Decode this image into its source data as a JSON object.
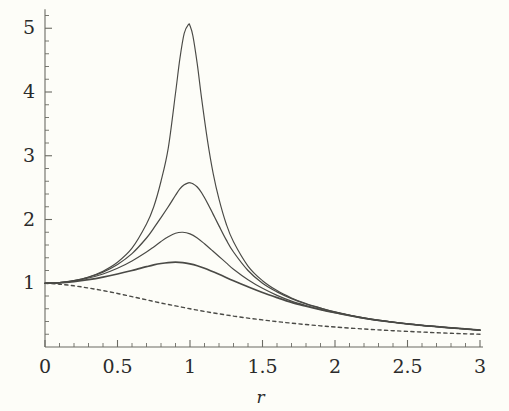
{
  "figure": {
    "background_color": "#fdfdf8",
    "axis_color": "#6b6b63",
    "curve_color": "#4a4a46",
    "text_color": "#2b2b2b"
  },
  "chart_data": {
    "type": "line",
    "title": "",
    "subtitle": "",
    "xlabel": "r",
    "ylabel": "",
    "xlim": [
      0,
      3
    ],
    "ylim": [
      0,
      5.35
    ],
    "grid": false,
    "legend": "none",
    "annotations": [],
    "x_ticks_major": [
      "0",
      "0.5",
      "1",
      "1.5",
      "2",
      "2.5",
      "3"
    ],
    "x_tick_values": [
      0,
      0.5,
      1,
      1.5,
      2,
      2.5,
      3
    ],
    "x_minor_tick_count_per_major": 5,
    "y_ticks_major": [
      "1",
      "2",
      "3",
      "4",
      "5"
    ],
    "y_tick_values": [
      1,
      2,
      3,
      4,
      5
    ],
    "y_minor_tick_count_per_major": 5,
    "series": [
      {
        "name": "zeta-0.10",
        "style": "solid",
        "peak_x": 1.06,
        "peak_y": 5.07,
        "x": [
          0.0,
          0.1,
          0.2,
          0.3,
          0.4,
          0.5,
          0.6,
          0.7,
          0.75,
          0.8,
          0.85,
          0.9,
          0.93,
          0.96,
          0.99,
          1.0,
          1.02,
          1.05,
          1.08,
          1.12,
          1.16,
          1.2,
          1.25,
          1.3,
          1.4,
          1.5,
          1.6,
          1.7,
          1.8,
          1.9,
          2.0,
          2.2,
          2.4,
          2.6,
          2.8,
          3.0
        ],
        "y": [
          1.0,
          1.01,
          1.042,
          1.099,
          1.19,
          1.33,
          1.55,
          1.93,
          2.2,
          2.6,
          3.12,
          3.98,
          4.52,
          4.92,
          5.06,
          5.04,
          4.88,
          4.44,
          3.9,
          3.25,
          2.72,
          2.32,
          1.93,
          1.65,
          1.27,
          1.04,
          0.885,
          0.77,
          0.68,
          0.61,
          0.55,
          0.455,
          0.39,
          0.34,
          0.3,
          0.265
        ]
      },
      {
        "name": "zeta-0.20",
        "style": "solid",
        "peak_x": 0.96,
        "peak_y": 2.58,
        "x": [
          0.0,
          0.1,
          0.2,
          0.3,
          0.4,
          0.5,
          0.6,
          0.7,
          0.75,
          0.8,
          0.85,
          0.9,
          0.93,
          0.96,
          0.99,
          1.0,
          1.02,
          1.05,
          1.08,
          1.12,
          1.16,
          1.2,
          1.25,
          1.3,
          1.4,
          1.5,
          1.6,
          1.7,
          1.8,
          1.9,
          2.0,
          2.2,
          2.4,
          2.6,
          2.8,
          3.0
        ],
        "y": [
          1.0,
          1.01,
          1.04,
          1.094,
          1.175,
          1.295,
          1.465,
          1.71,
          1.865,
          2.03,
          2.2,
          2.38,
          2.48,
          2.545,
          2.575,
          2.575,
          2.56,
          2.51,
          2.42,
          2.26,
          2.08,
          1.9,
          1.68,
          1.49,
          1.2,
          1.0,
          0.865,
          0.76,
          0.675,
          0.61,
          0.55,
          0.455,
          0.39,
          0.34,
          0.3,
          0.265
        ]
      },
      {
        "name": "zeta-0.30",
        "style": "solid",
        "peak_x": 0.9,
        "peak_y": 1.8,
        "x": [
          0.0,
          0.1,
          0.2,
          0.3,
          0.4,
          0.5,
          0.6,
          0.7,
          0.75,
          0.8,
          0.85,
          0.9,
          0.95,
          1.0,
          1.05,
          1.1,
          1.15,
          1.2,
          1.25,
          1.3,
          1.4,
          1.5,
          1.6,
          1.7,
          1.8,
          1.9,
          2.0,
          2.2,
          2.4,
          2.6,
          2.8,
          3.0
        ],
        "y": [
          1.0,
          1.009,
          1.036,
          1.082,
          1.146,
          1.235,
          1.35,
          1.49,
          1.57,
          1.655,
          1.73,
          1.785,
          1.8,
          1.775,
          1.71,
          1.62,
          1.52,
          1.42,
          1.32,
          1.22,
          1.055,
          0.92,
          0.81,
          0.72,
          0.65,
          0.59,
          0.54,
          0.45,
          0.388,
          0.338,
          0.3,
          0.265
        ]
      },
      {
        "name": "zeta-0.45",
        "style": "solid",
        "peak_x": 0.79,
        "peak_y": 1.33,
        "x": [
          0.0,
          0.1,
          0.2,
          0.3,
          0.4,
          0.5,
          0.6,
          0.7,
          0.75,
          0.8,
          0.85,
          0.9,
          0.95,
          1.0,
          1.05,
          1.1,
          1.2,
          1.3,
          1.4,
          1.5,
          1.6,
          1.7,
          1.8,
          1.9,
          2.0,
          2.2,
          2.4,
          2.6,
          2.8,
          3.0
        ],
        "y": [
          1.0,
          1.007,
          1.026,
          1.056,
          1.096,
          1.145,
          1.2,
          1.26,
          1.288,
          1.31,
          1.325,
          1.33,
          1.325,
          1.305,
          1.275,
          1.235,
          1.14,
          1.04,
          0.945,
          0.855,
          0.775,
          0.7,
          0.64,
          0.585,
          0.538,
          0.452,
          0.388,
          0.338,
          0.3,
          0.265
        ]
      },
      {
        "name": "static-decay-dashed",
        "style": "dashed",
        "peak_x": 0.0,
        "peak_y": 1.0,
        "x": [
          0.0,
          0.1,
          0.2,
          0.3,
          0.4,
          0.5,
          0.6,
          0.7,
          0.8,
          0.9,
          1.0,
          1.1,
          1.2,
          1.3,
          1.4,
          1.5,
          1.6,
          1.7,
          1.8,
          1.9,
          2.0,
          2.2,
          2.4,
          2.6,
          2.8,
          3.0
        ],
        "y": [
          1.0,
          0.985,
          0.96,
          0.925,
          0.885,
          0.84,
          0.79,
          0.74,
          0.69,
          0.645,
          0.6,
          0.558,
          0.52,
          0.485,
          0.453,
          0.425,
          0.398,
          0.374,
          0.352,
          0.332,
          0.314,
          0.282,
          0.256,
          0.234,
          0.215,
          0.2
        ]
      }
    ]
  }
}
